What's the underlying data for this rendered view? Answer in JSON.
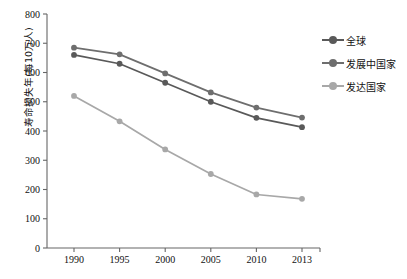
{
  "chart_data": {
    "type": "line",
    "title": "",
    "xlabel": "",
    "ylabel": "寿命损失年(每10万人)",
    "x": [
      "1990",
      "1995",
      "2000",
      "2005",
      "2010",
      "2013"
    ],
    "categories": [
      "1990",
      "1995",
      "2000",
      "2005",
      "2010",
      "2013"
    ],
    "ylim": [
      0,
      800
    ],
    "ytick_step": 100,
    "yticks": [
      "0",
      "100",
      "200",
      "300",
      "400",
      "500",
      "600",
      "700",
      "800"
    ],
    "grid": false,
    "legend_position": "right",
    "series": [
      {
        "name": "全球",
        "color": "#595959",
        "values": [
          660,
          630,
          565,
          500,
          445,
          413
        ]
      },
      {
        "name": "发展中国家",
        "color": "#6e6e6e",
        "values": [
          685,
          662,
          597,
          532,
          480,
          446
        ]
      },
      {
        "name": "发达国家",
        "color": "#a8a8a8",
        "values": [
          520,
          433,
          337,
          253,
          183,
          168
        ]
      }
    ]
  },
  "legend": {
    "items": [
      {
        "label": "全球",
        "color": "#595959"
      },
      {
        "label": "发展中国家",
        "color": "#6e6e6e"
      },
      {
        "label": "发达国家",
        "color": "#a8a8a8"
      }
    ]
  },
  "axes": {
    "y_title": "寿命损失年(每10万人)",
    "y_ticks": [
      "800",
      "700",
      "600",
      "500",
      "400",
      "300",
      "200",
      "100",
      "0"
    ],
    "x_ticks": [
      "1990",
      "1995",
      "2000",
      "2005",
      "2010",
      "2013"
    ],
    "axis_color": "#666666"
  }
}
